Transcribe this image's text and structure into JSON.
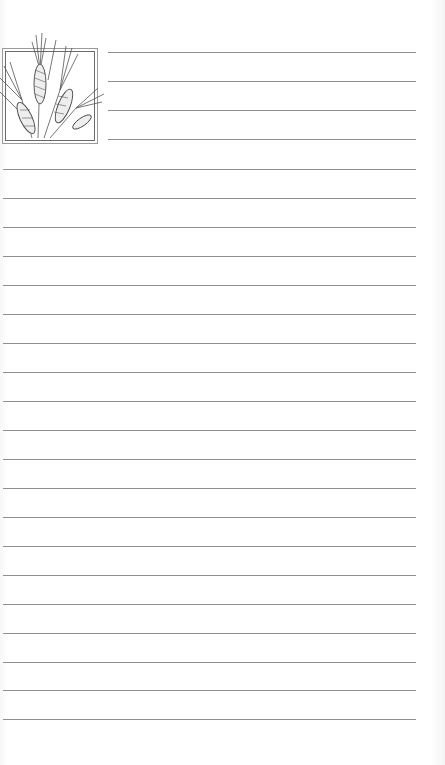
{
  "page": {
    "type": "lined notepad page",
    "background_color": "#ffffff",
    "line_color": "#8f8f8f"
  },
  "logo": {
    "icon": "wheat-sheaf-icon"
  },
  "short_lines": {
    "x_start": 108,
    "x_end": 416,
    "ys": [
      52,
      81,
      110,
      139
    ]
  },
  "full_lines": {
    "x_start": 3,
    "x_end": 416,
    "ys": [
      169,
      198,
      227,
      256,
      285,
      314,
      343,
      372,
      401,
      430,
      459,
      488,
      517,
      546,
      575,
      604,
      633,
      662,
      690,
      719
    ]
  }
}
